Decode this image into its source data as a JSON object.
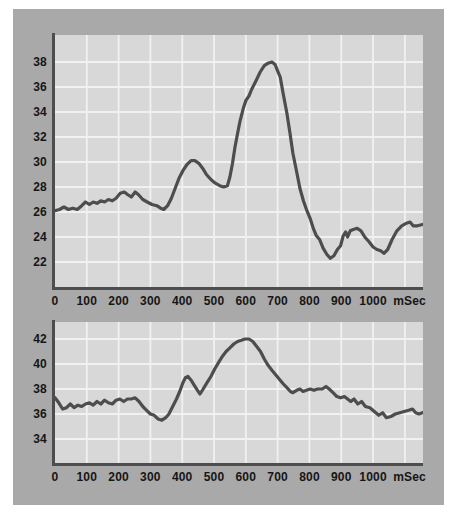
{
  "panel": {
    "background_color": "#a9a9a9",
    "plot_background_color": "#d8d8d8",
    "grid_color": "#f1f1f1",
    "axis_color": "#4d4d4d",
    "line_color": "#4d4d4d",
    "label_color": "#161616"
  },
  "chart_data": [
    {
      "type": "line",
      "title": "",
      "xlabel": "mSec",
      "ylabel": "",
      "x_unit_label": "mSec",
      "x_unit_label_pos": 1115,
      "x_ticks": [
        0,
        100,
        200,
        300,
        400,
        500,
        600,
        700,
        800,
        900,
        1000
      ],
      "x_gridlines": [
        100,
        200,
        300,
        400,
        500,
        600,
        700,
        800,
        900,
        1000,
        1100
      ],
      "x_max": 1157,
      "y_ticks": [
        38,
        36,
        34,
        32,
        30,
        28,
        26,
        24,
        22
      ],
      "y_axis_top_value": 40.16,
      "y_axis_bottom_value": 20.0,
      "grid": true,
      "legend": "none",
      "points": [
        [
          0,
          26.1
        ],
        [
          14,
          26.2
        ],
        [
          28,
          26.4
        ],
        [
          42,
          26.2
        ],
        [
          56,
          26.3
        ],
        [
          70,
          26.2
        ],
        [
          84,
          26.5
        ],
        [
          96,
          26.8
        ],
        [
          108,
          26.6
        ],
        [
          120,
          26.8
        ],
        [
          132,
          26.7
        ],
        [
          144,
          26.9
        ],
        [
          156,
          26.8
        ],
        [
          168,
          27.0
        ],
        [
          180,
          26.9
        ],
        [
          192,
          27.1
        ],
        [
          205,
          27.5
        ],
        [
          218,
          27.6
        ],
        [
          228,
          27.4
        ],
        [
          240,
          27.2
        ],
        [
          252,
          27.6
        ],
        [
          262,
          27.4
        ],
        [
          276,
          27.0
        ],
        [
          290,
          26.8
        ],
        [
          305,
          26.6
        ],
        [
          320,
          26.5
        ],
        [
          332,
          26.3
        ],
        [
          342,
          26.2
        ],
        [
          354,
          26.5
        ],
        [
          366,
          27.1
        ],
        [
          378,
          27.9
        ],
        [
          390,
          28.7
        ],
        [
          402,
          29.3
        ],
        [
          415,
          29.8
        ],
        [
          428,
          30.1
        ],
        [
          440,
          30.1
        ],
        [
          452,
          29.9
        ],
        [
          464,
          29.5
        ],
        [
          476,
          29.0
        ],
        [
          490,
          28.6
        ],
        [
          504,
          28.3
        ],
        [
          518,
          28.1
        ],
        [
          530,
          28.0
        ],
        [
          542,
          28.1
        ],
        [
          550,
          28.8
        ],
        [
          558,
          29.9
        ],
        [
          566,
          31.2
        ],
        [
          574,
          32.3
        ],
        [
          582,
          33.3
        ],
        [
          592,
          34.3
        ],
        [
          600,
          34.9
        ],
        [
          610,
          35.3
        ],
        [
          618,
          35.8
        ],
        [
          630,
          36.4
        ],
        [
          645,
          37.2
        ],
        [
          658,
          37.7
        ],
        [
          670,
          37.9
        ],
        [
          682,
          38.0
        ],
        [
          692,
          37.8
        ],
        [
          700,
          37.3
        ],
        [
          708,
          36.8
        ],
        [
          717,
          35.5
        ],
        [
          729,
          33.9
        ],
        [
          739,
          32.3
        ],
        [
          748,
          30.7
        ],
        [
          760,
          29.2
        ],
        [
          770,
          27.9
        ],
        [
          781,
          26.9
        ],
        [
          792,
          26.1
        ],
        [
          802,
          25.5
        ],
        [
          812,
          24.7
        ],
        [
          822,
          24.1
        ],
        [
          832,
          23.8
        ],
        [
          843,
          23.1
        ],
        [
          855,
          22.6
        ],
        [
          866,
          22.3
        ],
        [
          877,
          22.5
        ],
        [
          888,
          23.0
        ],
        [
          898,
          23.3
        ],
        [
          906,
          24.1
        ],
        [
          914,
          24.4
        ],
        [
          920,
          24.0
        ],
        [
          928,
          24.5
        ],
        [
          938,
          24.6
        ],
        [
          950,
          24.7
        ],
        [
          962,
          24.5
        ],
        [
          974,
          24.0
        ],
        [
          988,
          23.6
        ],
        [
          1000,
          23.2
        ],
        [
          1012,
          23.0
        ],
        [
          1024,
          22.9
        ],
        [
          1034,
          22.7
        ],
        [
          1046,
          23.0
        ],
        [
          1060,
          23.8
        ],
        [
          1075,
          24.5
        ],
        [
          1090,
          24.9
        ],
        [
          1105,
          25.1
        ],
        [
          1116,
          25.2
        ],
        [
          1126,
          24.9
        ],
        [
          1140,
          24.9
        ],
        [
          1155,
          25.0
        ]
      ]
    },
    {
      "type": "line",
      "title": "",
      "xlabel": "mSec",
      "ylabel": "",
      "x_unit_label": "mSec",
      "x_unit_label_pos": 1115,
      "x_ticks": [
        0,
        100,
        200,
        300,
        400,
        500,
        600,
        700,
        800,
        900,
        1000
      ],
      "x_gridlines": [
        100,
        200,
        300,
        400,
        500,
        600,
        700,
        800,
        900,
        1000,
        1100
      ],
      "x_max": 1157,
      "y_ticks": [
        42,
        40,
        38,
        36,
        34
      ],
      "y_axis_top_value": 43.36,
      "y_axis_bottom_value": 32.08,
      "grid": true,
      "legend": "none",
      "points": [
        [
          0,
          37.3
        ],
        [
          12,
          36.9
        ],
        [
          24,
          36.4
        ],
        [
          36,
          36.5
        ],
        [
          48,
          36.8
        ],
        [
          60,
          36.5
        ],
        [
          72,
          36.7
        ],
        [
          84,
          36.6
        ],
        [
          96,
          36.8
        ],
        [
          108,
          36.9
        ],
        [
          120,
          36.7
        ],
        [
          132,
          37.0
        ],
        [
          144,
          36.8
        ],
        [
          156,
          37.1
        ],
        [
          168,
          36.9
        ],
        [
          180,
          36.8
        ],
        [
          192,
          37.1
        ],
        [
          204,
          37.2
        ],
        [
          216,
          37.0
        ],
        [
          228,
          37.2
        ],
        [
          240,
          37.2
        ],
        [
          252,
          37.3
        ],
        [
          264,
          37.0
        ],
        [
          276,
          36.6
        ],
        [
          288,
          36.3
        ],
        [
          300,
          36.0
        ],
        [
          312,
          35.9
        ],
        [
          324,
          35.6
        ],
        [
          336,
          35.5
        ],
        [
          348,
          35.7
        ],
        [
          358,
          36.0
        ],
        [
          370,
          36.6
        ],
        [
          382,
          37.2
        ],
        [
          392,
          37.8
        ],
        [
          402,
          38.5
        ],
        [
          410,
          38.9
        ],
        [
          418,
          39.0
        ],
        [
          428,
          38.7
        ],
        [
          438,
          38.3
        ],
        [
          448,
          37.9
        ],
        [
          456,
          37.6
        ],
        [
          466,
          38.0
        ],
        [
          478,
          38.5
        ],
        [
          490,
          39.0
        ],
        [
          502,
          39.6
        ],
        [
          514,
          40.1
        ],
        [
          526,
          40.6
        ],
        [
          538,
          41.0
        ],
        [
          550,
          41.3
        ],
        [
          562,
          41.6
        ],
        [
          574,
          41.8
        ],
        [
          586,
          41.9
        ],
        [
          598,
          42.0
        ],
        [
          610,
          42.0
        ],
        [
          622,
          41.8
        ],
        [
          634,
          41.4
        ],
        [
          646,
          41.0
        ],
        [
          658,
          40.4
        ],
        [
          670,
          39.9
        ],
        [
          682,
          39.5
        ],
        [
          695,
          39.1
        ],
        [
          708,
          38.7
        ],
        [
          718,
          38.4
        ],
        [
          729,
          38.1
        ],
        [
          740,
          37.8
        ],
        [
          748,
          37.7
        ],
        [
          760,
          37.9
        ],
        [
          770,
          38.0
        ],
        [
          780,
          37.8
        ],
        [
          790,
          37.9
        ],
        [
          802,
          38.0
        ],
        [
          814,
          37.9
        ],
        [
          826,
          38.0
        ],
        [
          840,
          38.0
        ],
        [
          852,
          38.2
        ],
        [
          862,
          38.0
        ],
        [
          874,
          37.7
        ],
        [
          886,
          37.4
        ],
        [
          898,
          37.3
        ],
        [
          910,
          37.4
        ],
        [
          920,
          37.2
        ],
        [
          930,
          37.0
        ],
        [
          940,
          37.2
        ],
        [
          952,
          36.8
        ],
        [
          964,
          37.0
        ],
        [
          976,
          36.6
        ],
        [
          990,
          36.5
        ],
        [
          1004,
          36.2
        ],
        [
          1018,
          35.9
        ],
        [
          1030,
          36.1
        ],
        [
          1042,
          35.7
        ],
        [
          1056,
          35.8
        ],
        [
          1070,
          36.0
        ],
        [
          1084,
          36.1
        ],
        [
          1098,
          36.2
        ],
        [
          1112,
          36.3
        ],
        [
          1124,
          36.4
        ],
        [
          1134,
          36.1
        ],
        [
          1144,
          36.0
        ],
        [
          1155,
          36.1
        ]
      ]
    }
  ]
}
